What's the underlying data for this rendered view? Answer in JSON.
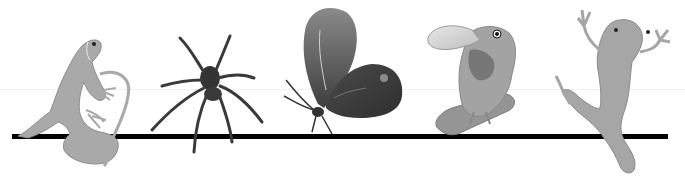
{
  "scene": {
    "description": "Grayscale illustration of five animals along a horizontal line",
    "animals": [
      {
        "name": "lizard",
        "tone": "#a8a8a8"
      },
      {
        "name": "spider",
        "tone": "#3a3a3a"
      },
      {
        "name": "butterfly",
        "tone": "#555555"
      },
      {
        "name": "toucan",
        "tone": "#9a9a9a"
      },
      {
        "name": "frog",
        "tone": "#a5a5a5"
      }
    ],
    "line_color": "#000000",
    "background": "#ffffff"
  }
}
